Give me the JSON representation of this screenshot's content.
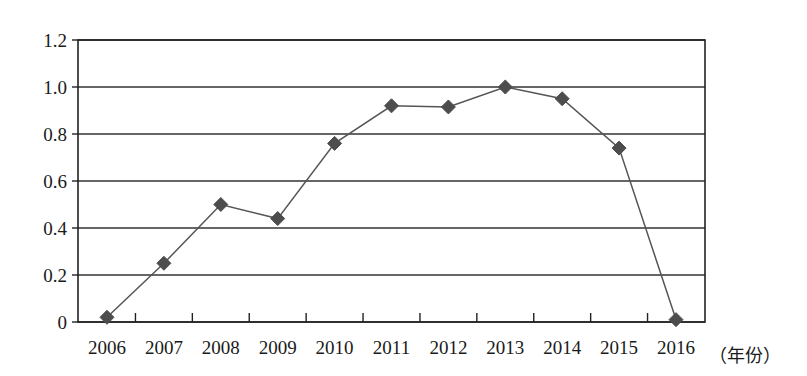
{
  "chart_data": {
    "type": "line",
    "title": "",
    "xlabel": "（年份）",
    "ylabel": "",
    "categories": [
      "2006",
      "2007",
      "2008",
      "2009",
      "2010",
      "2011",
      "2012",
      "2013",
      "2014",
      "2015",
      "2016"
    ],
    "values": [
      0.02,
      0.25,
      0.5,
      0.44,
      0.76,
      0.92,
      0.915,
      1.0,
      0.95,
      0.74,
      0.01
    ],
    "series": [
      {
        "name": "",
        "values": [
          0.02,
          0.25,
          0.5,
          0.44,
          0.76,
          0.92,
          0.915,
          1.0,
          0.95,
          0.74,
          0.01
        ]
      }
    ],
    "xtick_labels": [
      "2006",
      "2007",
      "2008",
      "2009",
      "2010",
      "2011",
      "2012",
      "2013",
      "2014",
      "2015",
      "2016"
    ],
    "ytick_labels": [
      "0",
      "0.2",
      "0.4",
      "0.6",
      "0.8",
      "1.0",
      "1.2"
    ],
    "ytick_values": [
      0,
      0.2,
      0.4,
      0.6,
      0.8,
      1.0,
      1.2
    ],
    "ylim": [
      0,
      1.2
    ],
    "grid": "horizontal",
    "legend": "none",
    "marker": "diamond",
    "colors": {
      "line": "#555555",
      "marker": "#4d4d4d",
      "grid": "#333333",
      "axis": "#222222",
      "text": "#1a1a1a",
      "background": "#ffffff"
    }
  },
  "yaxis": {
    "labels": [
      "1.2",
      "1.0",
      "0.8",
      "0.6",
      "0.4",
      "0.2",
      "0"
    ]
  },
  "xaxis": {
    "labels": [
      "2006",
      "2007",
      "2008",
      "2009",
      "2010",
      "2011",
      "2012",
      "2013",
      "2014",
      "2015",
      "2016"
    ],
    "unit_label": "（年份）"
  }
}
